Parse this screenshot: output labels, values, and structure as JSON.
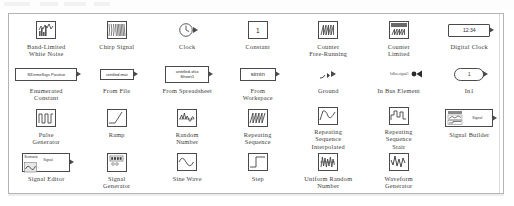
{
  "window": {
    "panel_name": "simulink-sources-library",
    "accent_color": "#4a4a4a",
    "panel_border_color": "#b4b4b4",
    "background_color": "#ffffff"
  },
  "library": {
    "blocks": [
      {
        "id": "band-limited-white-noise",
        "label": "Band-Limited\nWhite Noise",
        "icon": "noise-plot-icon",
        "inner_text": ""
      },
      {
        "id": "chirp-signal",
        "label": "Chirp Signal",
        "icon": "chirp-wave-icon",
        "inner_text": ""
      },
      {
        "id": "clock",
        "label": "Clock",
        "icon": "clock-face-icon",
        "inner_text": ""
      },
      {
        "id": "constant",
        "label": "Constant",
        "icon": "value-box-icon",
        "inner_text": "1"
      },
      {
        "id": "counter-free-running",
        "label": "Counter\nFree-Running",
        "icon": "counter-wave-icon",
        "inner_text": ""
      },
      {
        "id": "counter-limited",
        "label": "Counter\nLimited",
        "icon": "counter-limited-icon",
        "inner_text": ""
      },
      {
        "id": "digital-clock",
        "label": "Digital Clock",
        "icon": "digital-readout-icon",
        "inner_text": "12:34"
      },
      {
        "id": "enumerated-constant",
        "label": "Enumerated\nConstant",
        "icon": "enum-box-icon",
        "inner_text": "SlDemoSign.Positive"
      },
      {
        "id": "from-file",
        "label": "From File",
        "icon": "mat-file-icon",
        "inner_text": "untitled.mat"
      },
      {
        "id": "from-spreadsheet",
        "label": "From Spreadsheet",
        "icon": "spreadsheet-icon",
        "inner_text": "untitled.xlsx\nSheet1"
      },
      {
        "id": "from-workspace",
        "label": "From\nWorkspace",
        "icon": "workspace-var-icon",
        "inner_text": "simin"
      },
      {
        "id": "ground",
        "label": "Ground",
        "icon": "ground-symbol-icon",
        "inner_text": ""
      },
      {
        "id": "in-bus-element",
        "label": "In Bus Element",
        "icon": "bus-element-icon",
        "inner_text": "InBus.signal1"
      },
      {
        "id": "in1",
        "label": "In1",
        "icon": "inport-oval-icon",
        "inner_text": "1"
      },
      {
        "id": "pulse-generator",
        "label": "Pulse\nGenerator",
        "icon": "pulse-train-icon",
        "inner_text": ""
      },
      {
        "id": "ramp",
        "label": "Ramp",
        "icon": "ramp-slope-icon",
        "inner_text": ""
      },
      {
        "id": "random-number",
        "label": "Random\nNumber",
        "icon": "random-noise-icon",
        "inner_text": ""
      },
      {
        "id": "repeating-sequence",
        "label": "Repeating\nSequence",
        "icon": "sawtooth-icon",
        "inner_text": ""
      },
      {
        "id": "repeating-sequence-interpolated",
        "label": "Repeating\nSequence\nInterpolated",
        "icon": "interp-curve-icon",
        "inner_text": ""
      },
      {
        "id": "repeating-sequence-stair",
        "label": "Repeating\nSequence\nStair",
        "icon": "stair-step-icon",
        "inner_text": ""
      },
      {
        "id": "signal-builder",
        "label": "Signal Builder",
        "icon": "signal-builder-icon",
        "inner_text": "Signal"
      },
      {
        "id": "signal-editor",
        "label": "Signal Editor",
        "icon": "signal-editor-icon",
        "inner_text": "Scenario"
      },
      {
        "id": "signal-generator",
        "label": "Signal\nGenerator",
        "icon": "signal-generator-icon",
        "inner_text": ""
      },
      {
        "id": "sine-wave",
        "label": "Sine Wave",
        "icon": "sine-wave-icon",
        "inner_text": ""
      },
      {
        "id": "step",
        "label": "Step",
        "icon": "step-edge-icon",
        "inner_text": ""
      },
      {
        "id": "uniform-random-number",
        "label": "Uniform Random\nNumber",
        "icon": "uniform-random-icon",
        "inner_text": ""
      },
      {
        "id": "waveform-generator",
        "label": "Waveform\nGenerator",
        "icon": "waveform-icon",
        "inner_text": ""
      }
    ]
  }
}
